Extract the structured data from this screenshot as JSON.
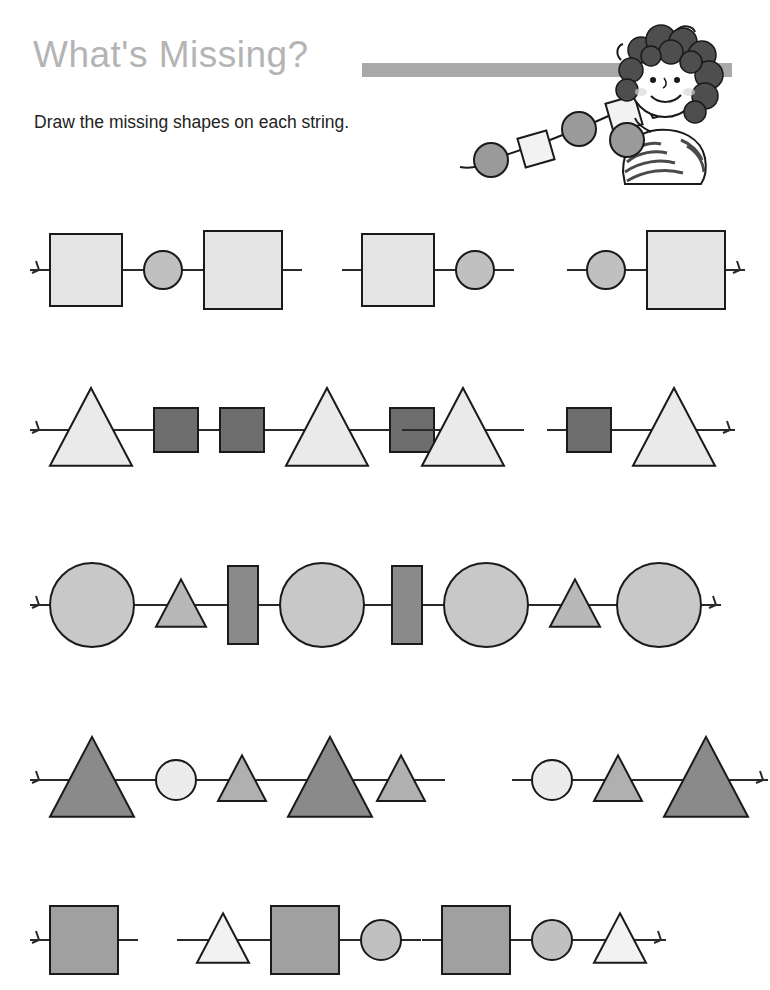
{
  "header": {
    "title": "What's Missing?",
    "instruction": "Draw the missing shapes on each string.",
    "title_color": "#b4b4b4",
    "bar_color": "#a9a9a9",
    "illustration_name": "girl-threading-beads"
  },
  "palette": {
    "outline": "#1a1a1a",
    "string": "#2a2a2a",
    "very_light": "#ececec",
    "light": "#e4e4e4",
    "medium_light": "#c8c8c8",
    "medium": "#b0b0b0",
    "gray": "#a0a0a0",
    "dark_gray": "#8a8a8a",
    "darkest": "#6e6e6e",
    "white_shape": "#f4f4f4",
    "page_bg": "#ffffff"
  },
  "worksheet": {
    "row_count": 5,
    "items_per_row": 3,
    "rows": [
      {
        "row_index": 1,
        "pattern_name": "square-circle-square",
        "items": [
          {
            "item_index": 1,
            "complete": true,
            "knot_left": true,
            "knot_right": false,
            "shapes": [
              {
                "type": "square",
                "size": 72,
                "fill": "#e4e4e4"
              },
              {
                "type": "circle",
                "size": 38,
                "fill": "#c0c0c0"
              },
              {
                "type": "square",
                "size": 78,
                "fill": "#e4e4e4"
              }
            ]
          },
          {
            "item_index": 2,
            "complete": false,
            "knot_left": false,
            "knot_right": false,
            "shapes": [
              {
                "type": "square",
                "size": 72,
                "fill": "#e4e4e4"
              },
              {
                "type": "circle",
                "size": 38,
                "fill": "#c0c0c0"
              }
            ]
          },
          {
            "item_index": 3,
            "complete": false,
            "knot_left": false,
            "knot_right": true,
            "shapes": [
              {
                "type": "circle",
                "size": 38,
                "fill": "#c0c0c0"
              },
              {
                "type": "square",
                "size": 78,
                "fill": "#e4e4e4"
              }
            ]
          }
        ]
      },
      {
        "row_index": 2,
        "pattern_name": "triangle-square-square",
        "items": [
          {
            "item_index": 1,
            "complete": true,
            "knot_left": true,
            "knot_right": false,
            "shapes": [
              {
                "type": "triangle",
                "size": 82,
                "fill": "#eaeaea"
              },
              {
                "type": "square",
                "size": 44,
                "fill": "#6e6e6e"
              },
              {
                "type": "square",
                "size": 44,
                "fill": "#6e6e6e"
              },
              {
                "type": "triangle",
                "size": 82,
                "fill": "#eaeaea"
              },
              {
                "type": "square",
                "size": 44,
                "fill": "#6e6e6e"
              }
            ]
          },
          {
            "item_index": 2,
            "complete": false,
            "knot_left": false,
            "knot_right": false,
            "shapes": [
              {
                "type": "triangle",
                "size": 82,
                "fill": "#eaeaea"
              }
            ]
          },
          {
            "item_index": 3,
            "complete": false,
            "knot_left": false,
            "knot_right": true,
            "shapes": [
              {
                "type": "square",
                "size": 44,
                "fill": "#6e6e6e"
              },
              {
                "type": "triangle",
                "size": 82,
                "fill": "#eaeaea"
              }
            ]
          }
        ]
      },
      {
        "row_index": 3,
        "pattern_name": "circle-triangle-rectangle",
        "items": [
          {
            "item_index": 1,
            "complete": true,
            "knot_left": true,
            "knot_right": false,
            "shapes": [
              {
                "type": "circle",
                "size": 84,
                "fill": "#c8c8c8"
              },
              {
                "type": "triangle",
                "size": 50,
                "fill": "#b8b8b8"
              },
              {
                "type": "rect-vertical",
                "size": 30,
                "fill": "#8a8a8a"
              },
              {
                "type": "circle",
                "size": 84,
                "fill": "#c8c8c8"
              }
            ]
          },
          {
            "item_index": 2,
            "complete": false,
            "knot_left": false,
            "knot_right": false,
            "shapes": [
              {
                "type": "rect-vertical",
                "size": 30,
                "fill": "#8a8a8a"
              },
              {
                "type": "circle",
                "size": 84,
                "fill": "#c8c8c8"
              },
              {
                "type": "triangle",
                "size": 50,
                "fill": "#b8b8b8"
              }
            ]
          },
          {
            "item_index": 3,
            "complete": false,
            "knot_left": false,
            "knot_right": true,
            "shapes": [
              {
                "type": "circle",
                "size": 84,
                "fill": "#c8c8c8"
              }
            ]
          }
        ]
      },
      {
        "row_index": 4,
        "pattern_name": "big-triangle-circle-small-triangle",
        "items": [
          {
            "item_index": 1,
            "complete": true,
            "knot_left": true,
            "knot_right": false,
            "shapes": [
              {
                "type": "triangle",
                "size": 84,
                "fill": "#8a8a8a"
              },
              {
                "type": "circle",
                "size": 40,
                "fill": "#ececec"
              },
              {
                "type": "triangle",
                "size": 48,
                "fill": "#b0b0b0"
              },
              {
                "type": "triangle",
                "size": 84,
                "fill": "#8a8a8a"
              }
            ]
          },
          {
            "item_index": 2,
            "complete": false,
            "knot_left": false,
            "knot_right": false,
            "shapes": [
              {
                "type": "triangle",
                "size": 48,
                "fill": "#b0b0b0"
              }
            ]
          },
          {
            "item_index": 3,
            "complete": false,
            "knot_left": false,
            "knot_right": true,
            "shapes": [
              {
                "type": "circle",
                "size": 40,
                "fill": "#ececec"
              },
              {
                "type": "triangle",
                "size": 48,
                "fill": "#b0b0b0"
              },
              {
                "type": "triangle",
                "size": 84,
                "fill": "#8a8a8a"
              }
            ]
          }
        ]
      },
      {
        "row_index": 5,
        "pattern_name": "square-circle-triangle",
        "items": [
          {
            "item_index": 1,
            "complete": false,
            "knot_left": true,
            "knot_right": false,
            "shapes": [
              {
                "type": "square",
                "size": 68,
                "fill": "#a0a0a0"
              }
            ]
          },
          {
            "item_index": 2,
            "complete": false,
            "knot_left": false,
            "knot_right": false,
            "shapes": [
              {
                "type": "triangle",
                "size": 52,
                "fill": "#f2f2f2"
              },
              {
                "type": "square",
                "size": 68,
                "fill": "#a0a0a0"
              },
              {
                "type": "circle",
                "size": 40,
                "fill": "#c0c0c0"
              }
            ]
          },
          {
            "item_index": 3,
            "complete": false,
            "knot_left": false,
            "knot_right": true,
            "shapes": [
              {
                "type": "square",
                "size": 68,
                "fill": "#a0a0a0"
              },
              {
                "type": "circle",
                "size": 40,
                "fill": "#c0c0c0"
              },
              {
                "type": "triangle",
                "size": 52,
                "fill": "#f2f2f2"
              }
            ]
          }
        ]
      }
    ]
  }
}
